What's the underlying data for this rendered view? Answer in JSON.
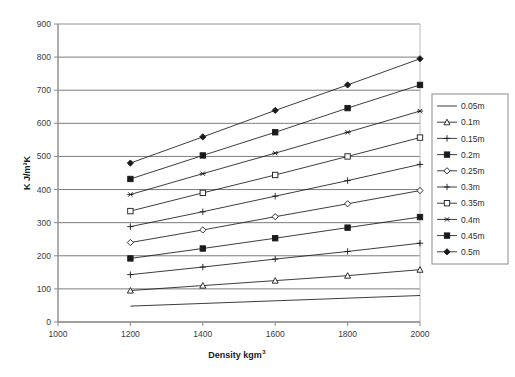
{
  "chart_data": {
    "type": "line",
    "title": "",
    "xlabel": "Density kgm",
    "xlabel_sup": "3",
    "ylabel": "K J/m³K",
    "xlim": [
      1000,
      2000
    ],
    "ylim": [
      0,
      900
    ],
    "x": [
      1200,
      1400,
      1600,
      1800,
      2000
    ],
    "xticks": [
      "1000",
      "1200",
      "1400",
      "1600",
      "1800",
      "2000"
    ],
    "yticks": [
      "0",
      "100",
      "200",
      "300",
      "400",
      "500",
      "600",
      "700",
      "800",
      "900"
    ],
    "grid": "horizontal",
    "legend_position": "right",
    "series": [
      {
        "name": "0.05m",
        "marker": "none",
        "values": [
          48,
          56,
          64,
          72,
          80
        ]
      },
      {
        "name": "0.1m",
        "marker": "open-triangle",
        "values": [
          95,
          110,
          125,
          140,
          158
        ]
      },
      {
        "name": "0.15m",
        "marker": "plus",
        "values": [
          143,
          166,
          190,
          213,
          238
        ]
      },
      {
        "name": "0.2m",
        "marker": "filled-square",
        "values": [
          192,
          222,
          253,
          285,
          317
        ]
      },
      {
        "name": "0.25m",
        "marker": "open-diamond",
        "values": [
          240,
          278,
          318,
          357,
          397
        ]
      },
      {
        "name": "0.3m",
        "marker": "plus",
        "values": [
          288,
          333,
          380,
          427,
          476
        ]
      },
      {
        "name": "0.35m",
        "marker": "open-square",
        "values": [
          335,
          390,
          444,
          500,
          557
        ]
      },
      {
        "name": "0.4m",
        "marker": "asterisk",
        "values": [
          385,
          448,
          510,
          573,
          637
        ]
      },
      {
        "name": "0.45m",
        "marker": "filled-square",
        "values": [
          432,
          503,
          573,
          646,
          716
        ]
      },
      {
        "name": "0.5m",
        "marker": "filled-diamond",
        "values": [
          480,
          559,
          639,
          716,
          795
        ]
      }
    ]
  },
  "colors": {
    "line": "#1a1a1a",
    "grid": "#6e6e6e",
    "axis": "#8c8c8c",
    "plot_border": "#b8b8b8",
    "legend_border": "#8c8c8c",
    "background": "#ffffff"
  }
}
